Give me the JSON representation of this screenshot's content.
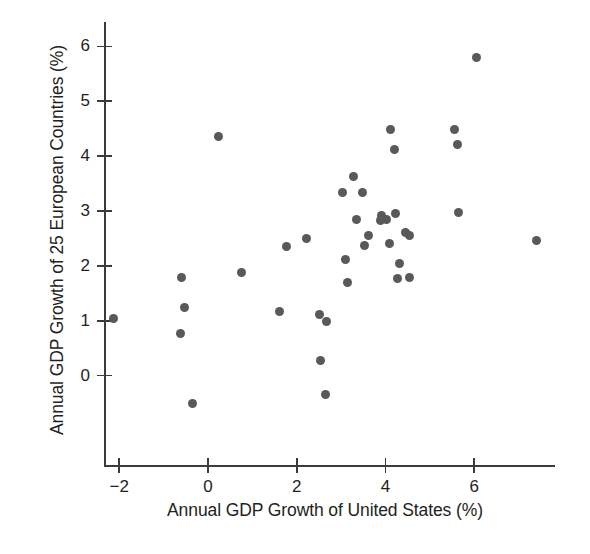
{
  "chart_data": {
    "type": "scatter",
    "title": "",
    "xlabel": "Annual GDP Growth of United States (%)",
    "ylabel": "Annual GDP Growth of 25 European Countries (%)",
    "xlim": [
      -2.7,
      7.8
    ],
    "ylim": [
      -0.85,
      6.4
    ],
    "xticks": [
      -2,
      0,
      2,
      4,
      6
    ],
    "xtick_labels": [
      "−2",
      "0",
      "2",
      "4",
      "6"
    ],
    "yticks": [
      0,
      1,
      2,
      3,
      4,
      5,
      6
    ],
    "ytick_labels": [
      "0",
      "1",
      "2",
      "3",
      "4",
      "5",
      "6"
    ],
    "grid": false,
    "legend": null,
    "marker": {
      "shape": "circle",
      "color": "#58595b",
      "size": 9
    },
    "points": [
      {
        "x": -2.12,
        "y": 1.05
      },
      {
        "x": -0.59,
        "y": 1.79
      },
      {
        "x": -0.52,
        "y": 1.24
      },
      {
        "x": -0.63,
        "y": 0.77
      },
      {
        "x": -0.36,
        "y": -0.51
      },
      {
        "x": 0.23,
        "y": 4.36
      },
      {
        "x": 0.75,
        "y": 1.88
      },
      {
        "x": 1.62,
        "y": 1.17
      },
      {
        "x": 1.78,
        "y": 2.35
      },
      {
        "x": 2.21,
        "y": 2.49
      },
      {
        "x": 2.52,
        "y": 1.11
      },
      {
        "x": 2.53,
        "y": 0.27
      },
      {
        "x": 2.68,
        "y": 0.99
      },
      {
        "x": 2.65,
        "y": -0.35
      },
      {
        "x": 3.04,
        "y": 3.33
      },
      {
        "x": 3.1,
        "y": 2.12
      },
      {
        "x": 3.15,
        "y": 1.7
      },
      {
        "x": 3.27,
        "y": 3.62
      },
      {
        "x": 3.35,
        "y": 2.85
      },
      {
        "x": 3.48,
        "y": 3.34
      },
      {
        "x": 3.52,
        "y": 2.38
      },
      {
        "x": 3.62,
        "y": 2.55
      },
      {
        "x": 3.88,
        "y": 2.82
      },
      {
        "x": 3.92,
        "y": 2.92
      },
      {
        "x": 4.02,
        "y": 2.85
      },
      {
        "x": 4.09,
        "y": 2.4
      },
      {
        "x": 4.12,
        "y": 4.48
      },
      {
        "x": 4.2,
        "y": 4.12
      },
      {
        "x": 4.22,
        "y": 2.95
      },
      {
        "x": 4.26,
        "y": 1.77
      },
      {
        "x": 4.32,
        "y": 2.04
      },
      {
        "x": 4.45,
        "y": 2.6
      },
      {
        "x": 4.55,
        "y": 2.55
      },
      {
        "x": 4.55,
        "y": 1.79
      },
      {
        "x": 5.55,
        "y": 4.48
      },
      {
        "x": 5.62,
        "y": 4.22
      },
      {
        "x": 5.65,
        "y": 2.98
      },
      {
        "x": 6.06,
        "y": 5.79
      },
      {
        "x": 7.41,
        "y": 2.47
      }
    ]
  }
}
